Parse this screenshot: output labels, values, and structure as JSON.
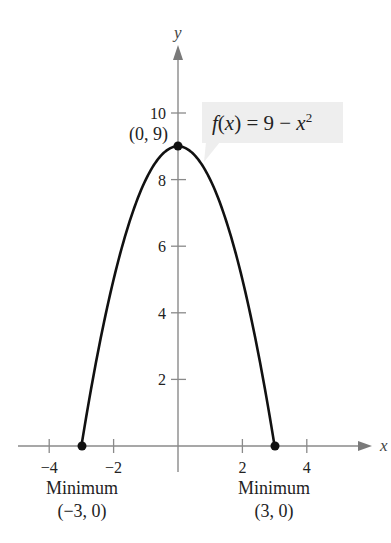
{
  "chart_data": {
    "type": "line",
    "title": "",
    "function_label": "f(x) = 9 − x²",
    "function_parts": {
      "fname": "f",
      "open": "(",
      "var": "x",
      "close": ")",
      "eq": " = 9 − ",
      "var2": "x",
      "exp": "2"
    },
    "xlabel": "x",
    "ylabel": "y",
    "xlim": [
      -5,
      6
    ],
    "ylim": [
      0,
      12
    ],
    "grid": false,
    "x_ticks": [
      -4,
      -2,
      2,
      4
    ],
    "x_tick_labels": [
      "−4",
      "−2",
      "2",
      "4"
    ],
    "y_ticks": [
      2,
      4,
      6,
      8,
      10
    ],
    "y_tick_labels": [
      "2",
      "4",
      "6",
      "8",
      "10"
    ],
    "series": [
      {
        "name": "f(x) = 9 − x²",
        "domain": [
          -3,
          3
        ],
        "x": [
          -3,
          -2.5,
          -2,
          -1.5,
          -1,
          -0.5,
          0,
          0.5,
          1,
          1.5,
          2,
          2.5,
          3
        ],
        "y": [
          0,
          2.75,
          5,
          6.75,
          8,
          8.75,
          9,
          8.75,
          8,
          6.75,
          5,
          2.75,
          0
        ],
        "color": "#111111"
      }
    ],
    "points": [
      {
        "x": 0,
        "y": 9,
        "label": "(0, 9)"
      },
      {
        "x": -3,
        "y": 0,
        "label": "(−3, 0)",
        "caption": "Minimum"
      },
      {
        "x": 3,
        "y": 0,
        "label": "(3, 0)",
        "caption": "Minimum"
      }
    ],
    "annotations": [
      {
        "text": "(0, 9)",
        "type": "point-label"
      },
      {
        "text": "Minimum",
        "sub": "(−3, 0)",
        "type": "point-caption"
      },
      {
        "text": "Minimum",
        "sub": "(3, 0)",
        "type": "point-caption"
      },
      {
        "text": "f(x) = 9 − x²",
        "type": "callout-box"
      }
    ]
  },
  "labels": {
    "apex": "(0, 9)",
    "left_min_title": "Minimum",
    "left_min_coords": "(−3, 0)",
    "right_min_title": "Minimum",
    "right_min_coords": "(3, 0)"
  },
  "colors": {
    "curve": "#111111",
    "axis": "#8a8a8a",
    "callout_fill": "#eeeeee",
    "text": "#222222"
  }
}
